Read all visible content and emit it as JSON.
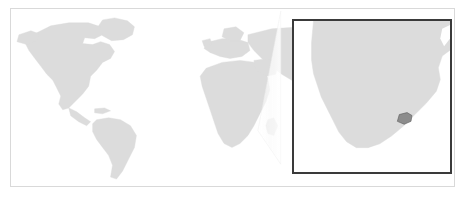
{
  "figure": {
    "kind": "locator-map",
    "title": "",
    "background_color": "#ffffff",
    "frame_color": "#d9d9d9"
  },
  "map": {
    "projection": "equirectangular",
    "land_color": "#dcdcdc",
    "ocean_color": "#ffffff",
    "land_stroke": "#dcdcdc",
    "regions": [
      "north-america",
      "south-america",
      "europe",
      "africa",
      "asia",
      "australia",
      "greenland",
      "madagascar"
    ]
  },
  "highlight": {
    "name": "lesotho",
    "color": "#8c8c8c",
    "stroke": "#5a5a5a",
    "visible_in": "inset"
  },
  "inset": {
    "label": "",
    "border_color": "#3a3a3a",
    "border_width_px": 2,
    "background_color": "#ffffff",
    "land_color": "#dcdcdc",
    "subject": "southern-africa",
    "zoom_region": "southern-africa"
  },
  "connector": {
    "type": "zoom-cone",
    "fill_color": "#f2f2f2",
    "opacity": 0.85,
    "apex": {
      "x": 258,
      "y": 131
    }
  },
  "legend": {
    "items": []
  },
  "annotations": []
}
